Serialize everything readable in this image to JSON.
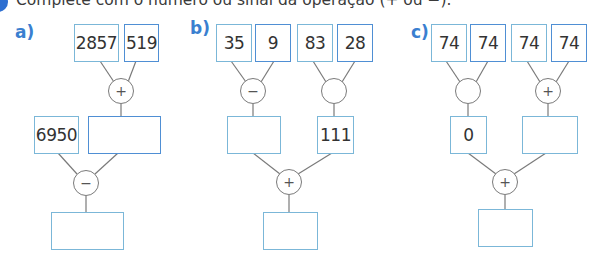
{
  "instruction": "Complete com o número ou sinal da operação (+ ou −).",
  "colors": {
    "label": "#3a7fd0",
    "box_border": "#7bb7d8",
    "box_border_alt": "#4f8fd4",
    "line": "#7a7a7a",
    "bullet": "#2e6fd1"
  },
  "problems": [
    {
      "label": "a)",
      "top_boxes": [
        {
          "value": "2857"
        },
        {
          "value": "519"
        }
      ],
      "op1": {
        "sign": "+"
      },
      "mid_boxes": [
        {
          "value": "6950"
        },
        {
          "value": ""
        }
      ],
      "op2": {
        "sign": "−"
      },
      "result": {
        "value": ""
      }
    },
    {
      "label": "b)",
      "top_boxes": [
        {
          "value": "35"
        },
        {
          "value": "9"
        },
        {
          "value": "83"
        },
        {
          "value": "28"
        }
      ],
      "op_left": {
        "sign": "−"
      },
      "op_right": {
        "sign": ""
      },
      "mid_boxes": [
        {
          "value": ""
        },
        {
          "value": "111"
        }
      ],
      "op_bottom": {
        "sign": "+"
      },
      "result": {
        "value": ""
      }
    },
    {
      "label": "c)",
      "top_boxes": [
        {
          "value": "74"
        },
        {
          "value": "74"
        },
        {
          "value": "74"
        },
        {
          "value": "74"
        }
      ],
      "op_left": {
        "sign": ""
      },
      "op_right": {
        "sign": "+"
      },
      "mid_boxes": [
        {
          "value": "0"
        },
        {
          "value": ""
        }
      ],
      "op_bottom": {
        "sign": "+"
      },
      "result": {
        "value": ""
      }
    }
  ]
}
